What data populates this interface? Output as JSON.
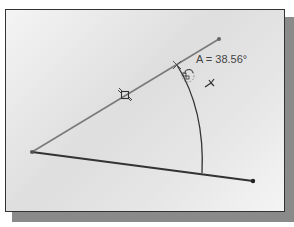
{
  "diagram": {
    "angle_label": "A = 38.56°",
    "colors": {
      "upper_line": "#7a7a7a",
      "lower_line": "#333333",
      "arc": "#333333",
      "text": "#444444"
    },
    "points": {
      "vertex": [
        32,
        152
      ],
      "upper_end": [
        219,
        39
      ],
      "lower_end": [
        253,
        181
      ],
      "arc_start": [
        177,
        65
      ],
      "arc_end": [
        202,
        173
      ]
    },
    "icons": [
      "parallel-constraint-icon",
      "cursor-crosshair-icon",
      "angle-dimension-cursor-icon",
      "dimension-tool-icon"
    ]
  }
}
